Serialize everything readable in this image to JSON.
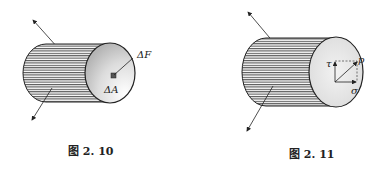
{
  "figures": [
    {
      "id": "fig-2-10",
      "caption": "图 2. 10",
      "labels": {
        "force": "ΔF",
        "area": "ΔA"
      }
    },
    {
      "id": "fig-2-11",
      "caption": "图 2. 11",
      "labels": {
        "resultant": "p",
        "shear": "τ",
        "normal": "σ"
      }
    }
  ],
  "colors": {
    "stroke": "#222222",
    "face_light": "#ffffff",
    "face_dark": "#bdbdbd"
  }
}
